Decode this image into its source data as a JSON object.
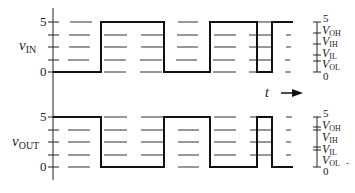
{
  "diagram": {
    "type": "digital timing diagram (inverter input/output)",
    "time_label": "t",
    "time_arrow": "right-arrow",
    "signals": [
      {
        "name": "v_IN",
        "label_main": "v",
        "label_sub": "IN",
        "y_axis_ticks": [
          "5",
          "0"
        ],
        "levels_sequence": [
          "low",
          "high",
          "low",
          "high",
          "low",
          "high"
        ],
        "scale": {
          "top": "5",
          "levels": [
            {
              "main": "V",
              "sub": "OH"
            },
            {
              "main": "V",
              "sub": "IH"
            },
            {
              "main": "V",
              "sub": "IL"
            },
            {
              "main": "V",
              "sub": "OL"
            }
          ],
          "bottom": "0"
        }
      },
      {
        "name": "v_OUT",
        "label_main": "v",
        "label_sub": "OUT",
        "y_axis_ticks": [
          "5",
          "0"
        ],
        "levels_sequence": [
          "high",
          "low",
          "high",
          "low",
          "high",
          "low"
        ],
        "scale": {
          "top": "5",
          "levels": [
            {
              "main": "V",
              "sub": "OH"
            },
            {
              "main": "V",
              "sub": "IH"
            },
            {
              "main": "V",
              "sub": "IL"
            },
            {
              "main": "V",
              "sub": "OL"
            }
          ],
          "bottom": "0",
          "trailing_mark": "."
        }
      }
    ]
  }
}
